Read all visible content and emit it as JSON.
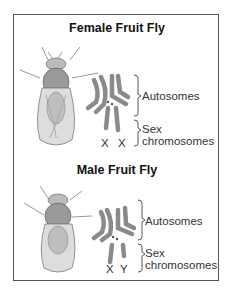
{
  "female": {
    "title": "Female Fruit Fly",
    "autosomes_label": "Autosomes",
    "sex_label_line1": "Sex",
    "sex_label_line2": "chromosomes",
    "sex_chromosomes": [
      "X",
      "X"
    ]
  },
  "male": {
    "title": "Male Fruit Fly",
    "autosomes_label": "Autosomes",
    "sex_label_line1": "Sex",
    "sex_label_line2": "chromosomes",
    "sex_chromosomes": [
      "X",
      "Y"
    ]
  },
  "colors": {
    "chromosome": "#8a8a8a",
    "border": "#555555",
    "text": "#333333"
  }
}
